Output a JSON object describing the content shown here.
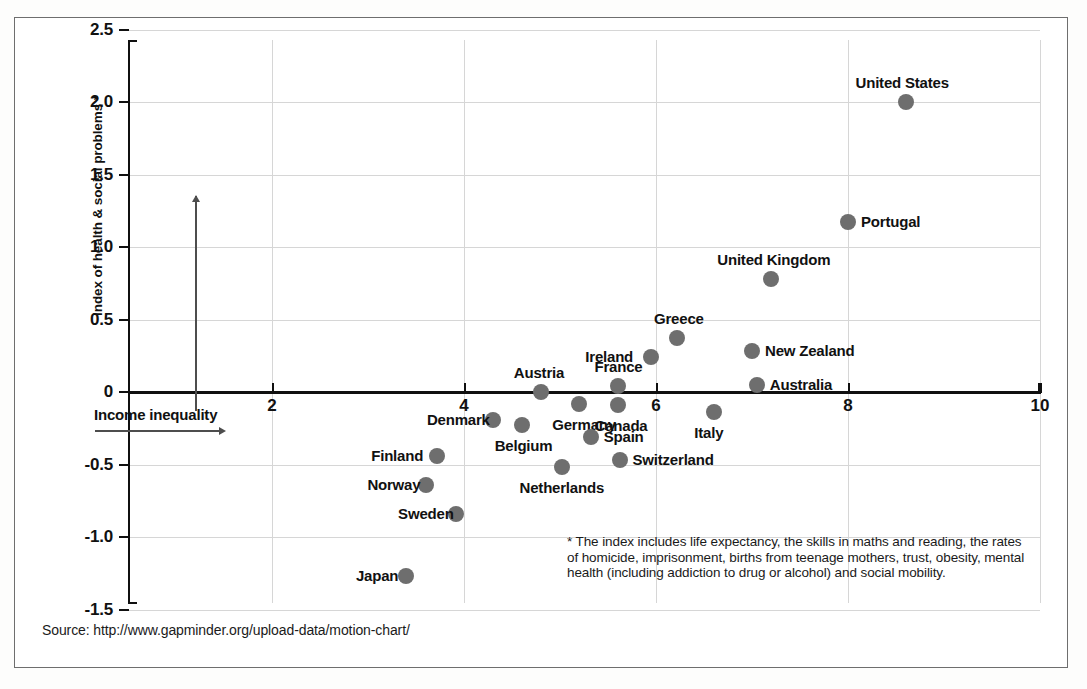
{
  "chart_data": {
    "type": "scatter",
    "title": "",
    "xlabel": "Income inequality",
    "ylabel": "Index of health & social problems *",
    "xlim": [
      1.0,
      10.4
    ],
    "ylim": [
      -1.5,
      2.5
    ],
    "x_ticks": [
      2,
      4,
      6,
      8,
      10
    ],
    "x_tick_labels": [
      "2",
      "4",
      "6",
      "8",
      "10"
    ],
    "y_ticks": [
      -1.5,
      -1.0,
      -0.5,
      0,
      0.5,
      1.0,
      1.5,
      2.0,
      2.5
    ],
    "y_tick_labels": [
      "-1.5",
      "-1.0",
      "-0.5",
      "0",
      "0.5",
      "1.0",
      "1.5",
      "2.0",
      "2.5"
    ],
    "grid": true,
    "legend": "none",
    "marker_color": "#6e6e6e",
    "points": [
      {
        "label": "United States",
        "x": 8.6,
        "y": 2.0,
        "label_pos": "above"
      },
      {
        "label": "Portugal",
        "x": 8.0,
        "y": 1.17,
        "label_pos": "right"
      },
      {
        "label": "United Kingdom",
        "x": 7.2,
        "y": 0.78,
        "label_pos": "above"
      },
      {
        "label": "Greece",
        "x": 6.22,
        "y": 0.37,
        "label_pos": "above"
      },
      {
        "label": "New Zealand",
        "x": 7.0,
        "y": 0.28,
        "label_pos": "right"
      },
      {
        "label": "Ireland",
        "x": 5.95,
        "y": 0.24,
        "label_pos": "left"
      },
      {
        "label": "Australia",
        "x": 7.05,
        "y": 0.05,
        "label_pos": "right"
      },
      {
        "label": "France",
        "x": 5.6,
        "y": 0.04,
        "label_pos": "above"
      },
      {
        "label": "Austria",
        "x": 4.8,
        "y": 0.0,
        "label_pos": "above"
      },
      {
        "label": "Germany",
        "x": 5.2,
        "y": -0.08,
        "label_pos": "below"
      },
      {
        "label": "Canada",
        "x": 5.6,
        "y": -0.09,
        "label_pos": "below"
      },
      {
        "label": "Italy",
        "x": 6.6,
        "y": -0.14,
        "label_pos": "below"
      },
      {
        "label": "Denmark",
        "x": 4.3,
        "y": -0.19,
        "label_pos": "left"
      },
      {
        "label": "Belgium",
        "x": 4.6,
        "y": -0.23,
        "label_pos": "below"
      },
      {
        "label": "Spain",
        "x": 5.32,
        "y": -0.31,
        "label_pos": "right"
      },
      {
        "label": "Finland",
        "x": 3.72,
        "y": -0.44,
        "label_pos": "left"
      },
      {
        "label": "Switzerland",
        "x": 5.62,
        "y": -0.47,
        "label_pos": "right"
      },
      {
        "label": "Netherlands",
        "x": 5.02,
        "y": -0.52,
        "label_pos": "below"
      },
      {
        "label": "Norway",
        "x": 3.6,
        "y": -0.64,
        "label_pos": "left"
      },
      {
        "label": "Sweden",
        "x": 3.92,
        "y": -0.84,
        "label_pos": "left"
      },
      {
        "label": "Japan",
        "x": 3.4,
        "y": -1.27,
        "label_pos": "left"
      }
    ]
  },
  "footnote": "* The index includes life expectancy, the skills in maths and reading, the rates of homicide, imprisonment, births from teenage mothers, trust, obesity, mental health (including addiction to drug or alcohol) and social mobility.",
  "source": "Source: http://www.gapminder.org/upload-data/motion-chart/"
}
